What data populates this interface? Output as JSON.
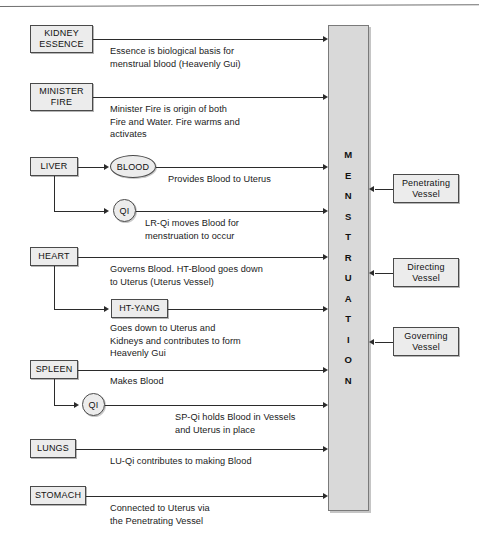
{
  "diagram": {
    "central_column": {
      "label": "MENSTRUATION",
      "letters": [
        "M",
        "E",
        "N",
        "S",
        "T",
        "R",
        "U",
        "A",
        "T",
        "I",
        "O",
        "N"
      ]
    },
    "organs": [
      {
        "id": "kidney-essence",
        "label_lines": [
          "KIDNEY",
          "ESSENCE"
        ],
        "caption": "Essence is biological basis for\nmenstrual blood (Heavenly Gui)"
      },
      {
        "id": "minister-fire",
        "label_lines": [
          "MINISTER",
          "FIRE"
        ],
        "caption": "Minister Fire is origin of both\nFire and Water. Fire warms and\nactivates"
      },
      {
        "id": "liver",
        "label_lines": [
          "LIVER"
        ],
        "caption": ""
      },
      {
        "id": "heart",
        "label_lines": [
          "HEART"
        ],
        "caption": "Governs Blood. HT-Blood goes down\nto Uterus (Uterus Vessel)"
      },
      {
        "id": "spleen",
        "label_lines": [
          "SPLEEN"
        ],
        "caption": "Makes Blood"
      },
      {
        "id": "lungs",
        "label_lines": [
          "LUNGS"
        ],
        "caption": "LU-Qi contributes to making Blood"
      },
      {
        "id": "stomach",
        "label_lines": [
          "STOMACH"
        ],
        "caption": "Connected to Uterus via\nthe Penetrating Vessel"
      }
    ],
    "sub_nodes": [
      {
        "id": "liver-blood",
        "label": "BLOOD",
        "shape": "ellipse",
        "caption": "Provides Blood to Uterus"
      },
      {
        "id": "liver-qi",
        "label": "QI",
        "shape": "circle",
        "caption": "LR-Qi moves Blood for\nmenstruation to occur"
      },
      {
        "id": "heart-yang",
        "label": "HT-YANG",
        "shape": "box",
        "caption": "Goes down to Uterus and\nKidneys and contributes to form\nHeavenly Gui"
      },
      {
        "id": "spleen-qi",
        "label": "QI",
        "shape": "circle",
        "caption": "SP-Qi holds Blood in Vessels\nand Uterus in place"
      }
    ],
    "vessels": [
      {
        "id": "penetrating-vessel",
        "label_lines": [
          "Penetrating",
          "Vessel"
        ]
      },
      {
        "id": "directing-vessel",
        "label_lines": [
          "Directing",
          "Vessel"
        ]
      },
      {
        "id": "governing-vessel",
        "label_lines": [
          "Governing",
          "Vessel"
        ]
      }
    ],
    "colors": {
      "node_fill": "#ececec",
      "column_fill": "#d9d9d9",
      "stroke": "#4a4a4a",
      "line": "#2b2b2b",
      "text": "#111111"
    }
  }
}
